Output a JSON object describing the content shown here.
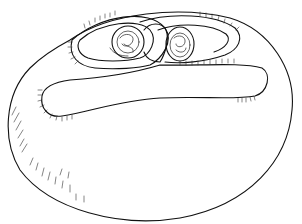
{
  "illustration": {
    "subject": "line drawing of an ovoid body with a coiled, ciliated tubular structure on top",
    "stroke_color": "#111111",
    "background_color": "#ffffff",
    "parts": [
      "outer-ovoid-body",
      "upper-loop",
      "lower-elongated-loop",
      "left-coiled-chamber",
      "right-coiled-chamber",
      "ciliary-fringes",
      "shading-hatches"
    ]
  }
}
